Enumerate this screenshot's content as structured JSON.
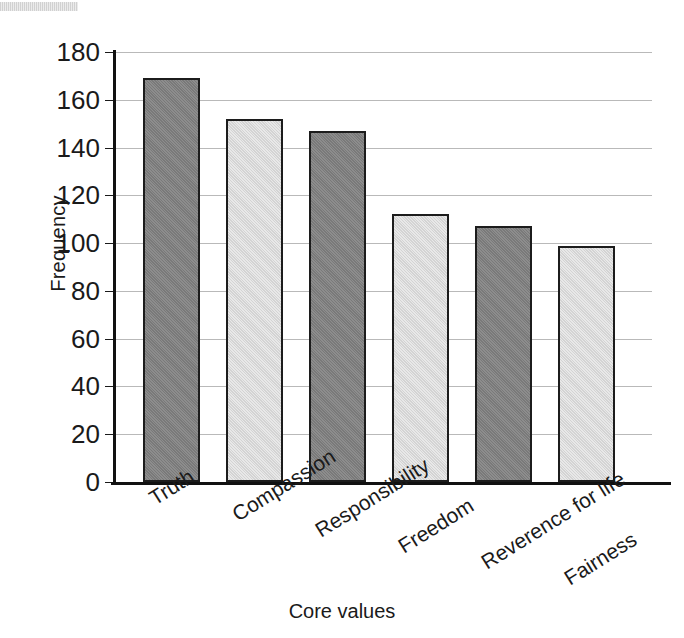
{
  "chart_data": {
    "type": "bar",
    "title": "",
    "xlabel": "Core values",
    "ylabel": "Frequency",
    "categories": [
      "Truth",
      "Compassion",
      "Responsibility",
      "Freedom",
      "Reverence for life",
      "Fairness"
    ],
    "values": [
      169,
      152,
      147,
      112,
      107,
      99
    ],
    "series": [
      {
        "name": "Frequency",
        "values": [
          169,
          152,
          147,
          112,
          107,
          99
        ]
      }
    ],
    "bar_colors": [
      "#808080",
      "#dcdcdc",
      "#808080",
      "#dcdcdc",
      "#808080",
      "#dcdcdc"
    ],
    "bar_edge_color": "#1c1c1c",
    "ylim": [
      0,
      180
    ],
    "ytick_labels": [
      "180",
      "160",
      "140",
      "120",
      "100",
      "80",
      "60",
      "40",
      "20",
      "0"
    ],
    "ytick_values": [
      180,
      160,
      140,
      120,
      100,
      80,
      60,
      40,
      20,
      0
    ],
    "grid": true,
    "gridline_color": "#b9b9b9",
    "legend": "none",
    "xtick_rotation_degrees": -32
  },
  "axes": {
    "y_title": "Frequency",
    "x_title": "Core values"
  },
  "artifacts": {
    "scan_band": "scan-artifact-band"
  }
}
